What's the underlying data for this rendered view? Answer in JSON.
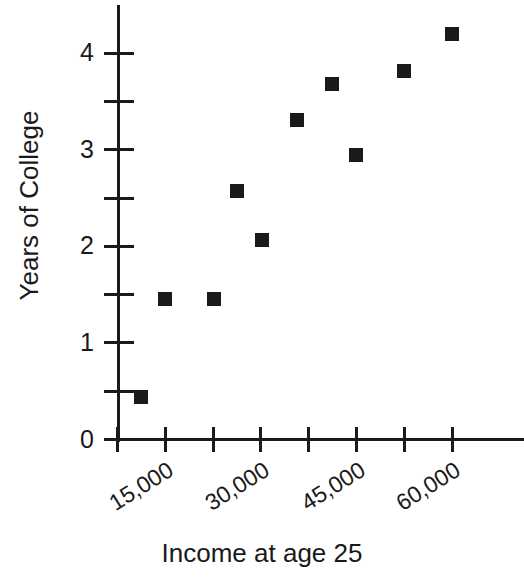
{
  "chart_data": {
    "type": "scatter",
    "title": "",
    "xlabel": "Income at age 25",
    "ylabel": "Years of College",
    "xlim": [
      7500,
      67500
    ],
    "ylim": [
      0,
      4.5
    ],
    "grid": false,
    "legend": null,
    "marker": {
      "shape": "square",
      "color": "#1a1a1a",
      "size": 14
    },
    "x_tick_values": [
      7500,
      15000,
      22500,
      30000,
      37500,
      45000,
      52500,
      60000
    ],
    "x_tick_labels": [
      "",
      "15,000",
      "",
      "30,000",
      "",
      "45,000",
      "",
      "60,000"
    ],
    "x_labeled_ticks": [
      {
        "value": 15000,
        "label": "15,000"
      },
      {
        "value": 30000,
        "label": "30,000"
      },
      {
        "value": 45000,
        "label": "45,000"
      },
      {
        "value": 60000,
        "label": "60,000"
      }
    ],
    "y_tick_values": [
      0,
      0.5,
      1,
      1.5,
      2,
      2.5,
      3,
      3.5,
      4
    ],
    "y_major_ticks": [
      {
        "value": 0,
        "label": "0"
      },
      {
        "value": 1,
        "label": "1"
      },
      {
        "value": 2,
        "label": "2"
      },
      {
        "value": 3,
        "label": "3"
      },
      {
        "value": 4,
        "label": "4"
      }
    ],
    "y_minor_ticks": [
      0.5,
      1.5,
      2.5,
      3.5
    ],
    "points": [
      {
        "x": 11200,
        "y": 0.44
      },
      {
        "x": 15000,
        "y": 1.45
      },
      {
        "x": 22700,
        "y": 1.45
      },
      {
        "x": 26200,
        "y": 2.57
      },
      {
        "x": 30100,
        "y": 2.07
      },
      {
        "x": 35600,
        "y": 3.31
      },
      {
        "x": 41200,
        "y": 3.68
      },
      {
        "x": 44900,
        "y": 2.94
      },
      {
        "x": 52500,
        "y": 3.81
      },
      {
        "x": 60000,
        "y": 4.2
      }
    ],
    "x": [
      11200,
      15000,
      22700,
      26200,
      30100,
      35600,
      41200,
      44900,
      52500,
      60000
    ],
    "values": [
      0.44,
      1.45,
      1.45,
      2.57,
      2.07,
      3.31,
      3.68,
      2.94,
      3.81,
      4.2
    ]
  }
}
